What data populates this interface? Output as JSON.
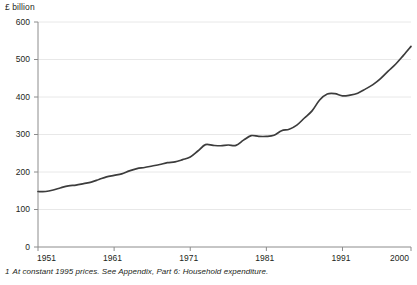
{
  "chart_data": {
    "type": "line",
    "title": "",
    "subtitle": "",
    "ylabel": "£ billion",
    "xlabel": "",
    "ylim": [
      0,
      600
    ],
    "xlim": [
      1951,
      2000
    ],
    "yticks": [
      0,
      100,
      200,
      300,
      400,
      500,
      600
    ],
    "ytick_labels": [
      "0",
      "100",
      "200",
      "300",
      "400",
      "500",
      "600"
    ],
    "xticks": [
      1951,
      1961,
      1971,
      1981,
      1991,
      2000
    ],
    "xtick_labels": [
      "1951",
      "1961",
      "1971",
      "1981",
      "1991",
      "2000"
    ],
    "grid": "horizontal",
    "legend": "none",
    "line_color": "#3c3c3c",
    "grid_color": "#e8e8e8",
    "axis_color": "#8c8c8c",
    "series": [
      {
        "name": "Household expenditure",
        "x": [
          1951,
          1952,
          1953,
          1954,
          1955,
          1956,
          1957,
          1958,
          1959,
          1960,
          1961,
          1962,
          1963,
          1964,
          1965,
          1966,
          1967,
          1968,
          1969,
          1970,
          1971,
          1972,
          1973,
          1974,
          1975,
          1976,
          1977,
          1978,
          1979,
          1980,
          1981,
          1982,
          1983,
          1984,
          1985,
          1986,
          1987,
          1988,
          1989,
          1990,
          1991,
          1992,
          1993,
          1994,
          1995,
          1996,
          1997,
          1998,
          1999,
          2000
        ],
        "values": [
          148,
          148,
          152,
          158,
          163,
          165,
          169,
          173,
          180,
          187,
          191,
          195,
          203,
          209,
          212,
          216,
          220,
          225,
          227,
          233,
          240,
          256,
          273,
          271,
          270,
          272,
          271,
          285,
          297,
          295,
          295,
          298,
          310,
          314,
          325,
          344,
          363,
          392,
          408,
          409,
          403,
          405,
          410,
          421,
          433,
          449,
          469,
          488,
          511,
          535
        ]
      }
    ]
  },
  "footnote": {
    "marker": "1",
    "text": "At constant 1995 prices. See Appendix, Part 6: Household expenditure."
  }
}
